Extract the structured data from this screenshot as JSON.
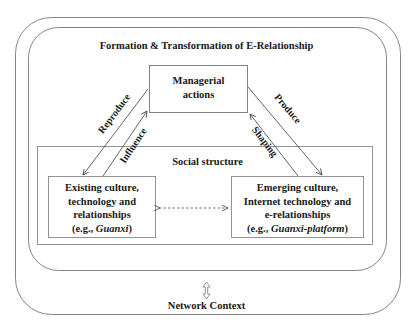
{
  "diagram": {
    "title": "Formation & Transformation of E-Relationship",
    "managerial_box": {
      "line1": "Managerial",
      "line2": "actions"
    },
    "social_structure_label": "Social structure",
    "existing_box": {
      "line1": "Existing culture,",
      "line2": "technology and",
      "line3": "relationships",
      "example_prefix": "(e.g., ",
      "example_italic": "Guanxi",
      "example_suffix": ")"
    },
    "emerging_box": {
      "line1": "Emerging culture,",
      "line2": "Internet technology and",
      "line3": "e-relationships",
      "example_prefix": "(e.g., ",
      "example_italic": "Guanxi-platform",
      "example_suffix": ")"
    },
    "arrows": {
      "reproduce": "Reproduce",
      "influence": "Influence",
      "produce": "Produce",
      "shaping": "Shaping"
    },
    "network_context_label": "Network Context",
    "colors": {
      "line": "#6b6b6b",
      "text": "#1a1a1a",
      "background": "#ffffff"
    }
  }
}
